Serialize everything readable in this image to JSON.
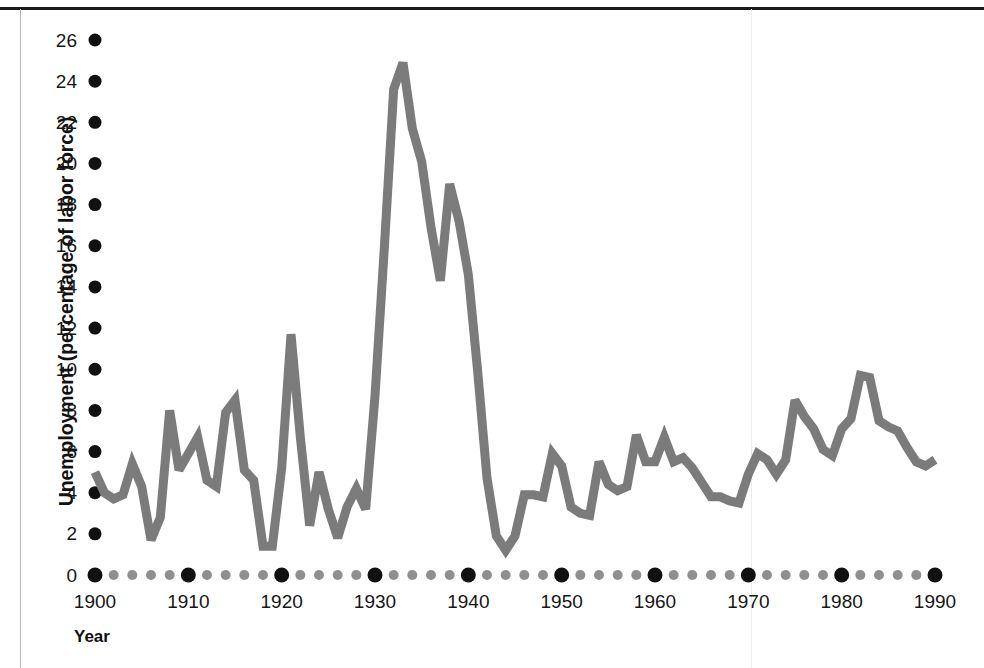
{
  "figure": {
    "background_color": "#ffffff",
    "line_color": "#7b7b7b",
    "tick_major_color": "#111111",
    "tick_minor_color": "#8f8f8f",
    "frame_color": "#1a1a1a"
  },
  "axes": {
    "y_axis_title": "Unemployment (percentage of labor force)",
    "x_axis_title": "Year",
    "y_ticks": [
      "0",
      "2",
      "4",
      "6",
      "8",
      "10",
      "12",
      "14",
      "16",
      "18",
      "20",
      "22",
      "24",
      "26"
    ],
    "x_ticks": [
      "1900",
      "1910",
      "1920",
      "1930",
      "1940",
      "1950",
      "1960",
      "1970",
      "1980",
      "1990"
    ]
  },
  "chart_data": {
    "type": "line",
    "title": "",
    "xlabel": "Year",
    "ylabel": "Unemployment (percentage of labor force)",
    "xlim": [
      1900,
      1990
    ],
    "ylim": [
      0,
      26
    ],
    "grid": false,
    "legend": false,
    "x_tick_step_major": 10,
    "x_tick_step_minor": 2,
    "y_tick_step": 2,
    "series": [
      {
        "name": "Unemployment rate",
        "color": "#7b7b7b",
        "x": [
          1900,
          1901,
          1902,
          1903,
          1904,
          1905,
          1906,
          1907,
          1908,
          1909,
          1910,
          1911,
          1912,
          1913,
          1914,
          1915,
          1916,
          1917,
          1918,
          1919,
          1920,
          1921,
          1922,
          1923,
          1924,
          1925,
          1926,
          1927,
          1928,
          1929,
          1930,
          1931,
          1932,
          1933,
          1934,
          1935,
          1936,
          1937,
          1938,
          1939,
          1940,
          1941,
          1942,
          1943,
          1944,
          1945,
          1946,
          1947,
          1948,
          1949,
          1950,
          1951,
          1952,
          1953,
          1954,
          1955,
          1956,
          1957,
          1958,
          1959,
          1960,
          1961,
          1962,
          1963,
          1964,
          1965,
          1966,
          1967,
          1968,
          1969,
          1970,
          1971,
          1972,
          1973,
          1974,
          1975,
          1976,
          1977,
          1978,
          1979,
          1980,
          1981,
          1982,
          1983,
          1984,
          1985,
          1986,
          1987,
          1988,
          1989,
          1990
        ],
        "values": [
          5.0,
          4.0,
          3.7,
          3.9,
          5.4,
          4.3,
          1.7,
          2.8,
          8.0,
          5.1,
          5.9,
          6.7,
          4.6,
          4.3,
          7.9,
          8.5,
          5.1,
          4.6,
          1.4,
          1.4,
          5.2,
          11.7,
          6.7,
          2.4,
          5.0,
          3.2,
          1.8,
          3.3,
          4.2,
          3.2,
          8.7,
          15.9,
          23.6,
          24.9,
          21.7,
          20.1,
          16.9,
          14.3,
          19.0,
          17.2,
          14.6,
          9.9,
          4.7,
          1.9,
          1.2,
          1.9,
          3.9,
          3.9,
          3.8,
          5.9,
          5.3,
          3.3,
          3.0,
          2.9,
          5.5,
          4.4,
          4.1,
          4.3,
          6.8,
          5.5,
          5.5,
          6.7,
          5.5,
          5.7,
          5.2,
          4.5,
          3.8,
          3.8,
          3.6,
          3.5,
          4.9,
          5.9,
          5.6,
          4.9,
          5.6,
          8.5,
          7.7,
          7.1,
          6.1,
          5.8,
          7.1,
          7.6,
          9.7,
          9.6,
          7.5,
          7.2,
          7.0,
          6.2,
          5.5,
          5.3,
          5.6
        ]
      }
    ]
  }
}
